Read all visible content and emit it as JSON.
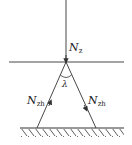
{
  "diagram": {
    "type": "force-diagram",
    "colors": {
      "line": "#333333",
      "background": "#ffffff"
    },
    "labels": {
      "vertical_force": {
        "main": "N",
        "sub": "z"
      },
      "left_strut_force": {
        "main": "N",
        "sub": "zh"
      },
      "right_strut_force": {
        "main": "N",
        "sub": "zh"
      },
      "angle": "λ"
    }
  }
}
